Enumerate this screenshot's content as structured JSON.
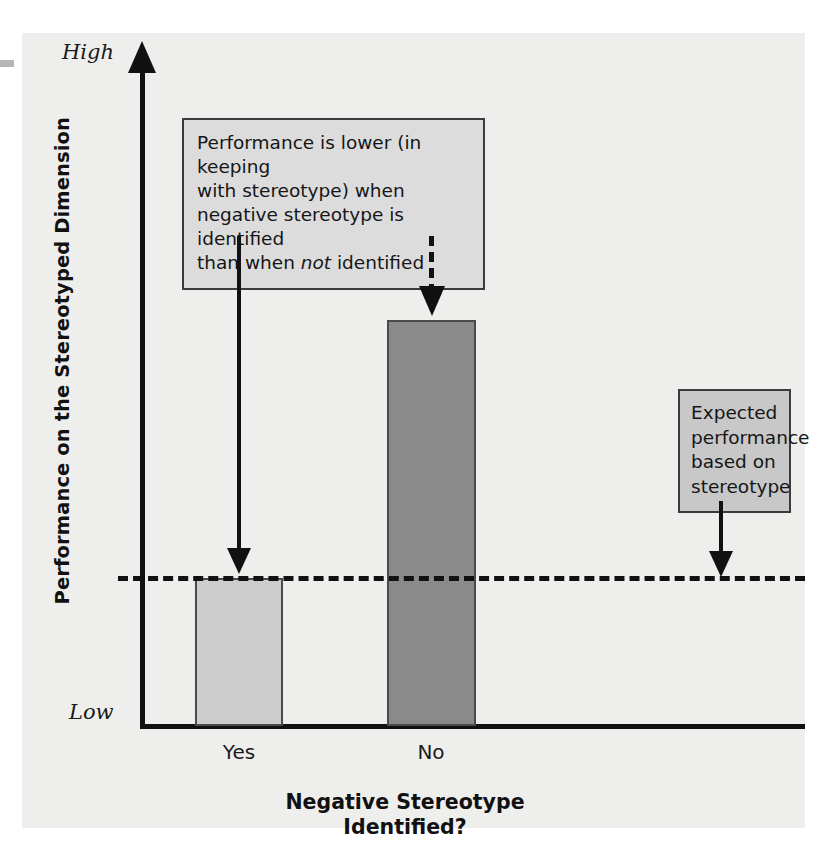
{
  "chart_data": {
    "type": "bar",
    "title": "",
    "categories": [
      "Yes",
      "No"
    ],
    "values": [
      1.0,
      2.75
    ],
    "series": [
      {
        "name": "Performance on the Stereotyped Dimension",
        "values": [
          1.0,
          2.75
        ]
      }
    ],
    "xlabel": "Negative Stereotype Identified?",
    "ylabel": "Performance on the Stereotyped Dimension",
    "ylim": [
      0,
      4.45
    ],
    "y_tick_labels": [
      "Low",
      "High"
    ],
    "grid": false,
    "legend": false,
    "reference_line": {
      "label": "Expected performance based on stereotype",
      "value": 1.0,
      "style": "dashed"
    },
    "annotations": [
      "Performance is lower (in keeping with stereotype) when negative stereotype is identified than when not identified",
      "Expected performance based on stereotype"
    ],
    "colors": {
      "bar_yes": "#cdcdcd",
      "bar_no": "#8a8a8a",
      "bar_border": "#4a4a4a",
      "panel_background": "#eeeeec",
      "axis": "#111111",
      "callout_left_fill": "#dcdcdc",
      "callout_right_fill": "#c8c8c8",
      "callout_border": "#3b3b3b"
    }
  },
  "axes": {
    "y_top_label": "High",
    "y_bottom_label": "Low",
    "y_title": "Performance on the Stereotyped Dimension",
    "x_title_line1": "Negative Stereotype",
    "x_title_line2": "Identified?"
  },
  "categories": {
    "yes": "Yes",
    "no": "No"
  },
  "callouts": {
    "performance": {
      "line1": "Performance is lower (in keeping",
      "line2": "with stereotype) when",
      "line3": "negative stereotype is identified",
      "line4_pre": "than when ",
      "line4_em": "not",
      "line4_post": " identified"
    },
    "expected": {
      "line1": "Expected",
      "line2": "performance",
      "line3": "based on",
      "line4": "stereotype"
    }
  }
}
